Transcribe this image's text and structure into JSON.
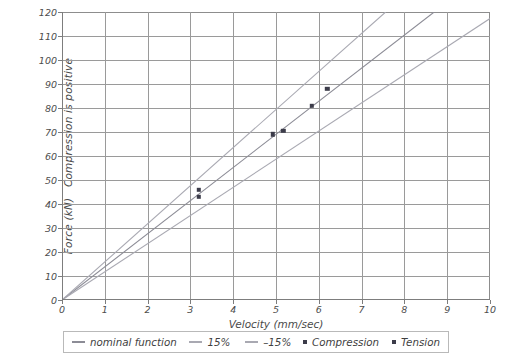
{
  "chart_data": {
    "type": "scatter",
    "title": "",
    "xlabel": "Velocity (mm/sec)",
    "ylabel": "Force (kN)   Compression is positive",
    "xlim": [
      0,
      10
    ],
    "ylim": [
      0,
      120
    ],
    "xticks": [
      "0",
      "1",
      "2",
      "3",
      "4",
      "5",
      "6",
      "7",
      "8",
      "9",
      "10"
    ],
    "yticks": [
      "0",
      "10",
      "20",
      "30",
      "40",
      "50",
      "60",
      "70",
      "80",
      "90",
      "100",
      "110",
      "120"
    ],
    "grid": true,
    "legend_position": "below",
    "series": [
      {
        "name": "nominal function",
        "type": "line",
        "color": "#8c8c96",
        "x": [
          0,
          10
        ],
        "y": [
          0,
          138
        ]
      },
      {
        "name": "15%",
        "type": "line",
        "color": "#a9a9b2",
        "x": [
          0,
          10
        ],
        "y": [
          0,
          158.7
        ]
      },
      {
        "name": "-15%",
        "type": "line",
        "color": "#a9a9b2",
        "x": [
          0,
          10
        ],
        "y": [
          0,
          117.3
        ]
      },
      {
        "name": "Compression",
        "type": "scatter",
        "marker": "square",
        "color": "#3c3c4a",
        "points": [
          {
            "x": 3.2,
            "y": 46
          },
          {
            "x": 4.92,
            "y": 69
          },
          {
            "x": 5.84,
            "y": 81
          },
          {
            "x": 6.2,
            "y": 88
          }
        ]
      },
      {
        "name": "Tension",
        "type": "scatter",
        "marker": "square",
        "color": "#3c3c4a",
        "points": [
          {
            "x": 3.2,
            "y": 43
          },
          {
            "x": 5.17,
            "y": 70.5
          }
        ]
      }
    ]
  },
  "axes": {
    "y_title": "Force (kN)   Compression is positive",
    "x_title": "Velocity (mm/sec)"
  },
  "legend": {
    "items": [
      {
        "label": "nominal function",
        "marker": "line"
      },
      {
        "label": "15%",
        "marker": "line"
      },
      {
        "label": "–15%",
        "marker": "line"
      },
      {
        "label": "Compression",
        "marker": "square"
      },
      {
        "label": "Tension",
        "marker": "square"
      }
    ]
  }
}
